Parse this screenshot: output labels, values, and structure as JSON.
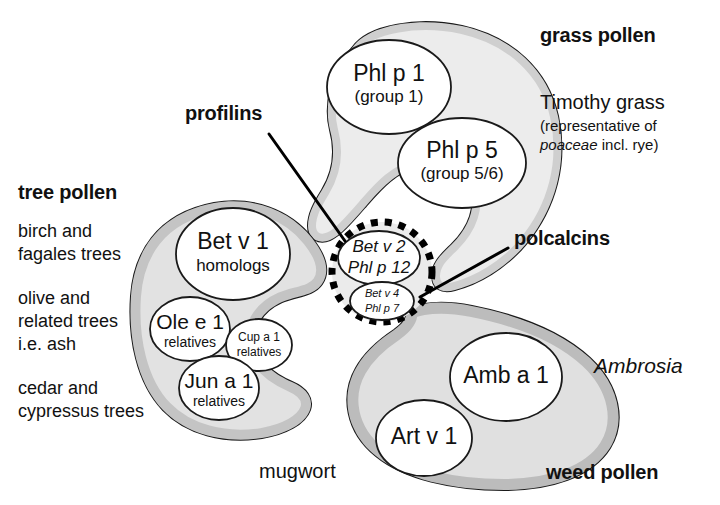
{
  "diagram": {
    "colors": {
      "lobe_light": "#ececec",
      "lobe_mid": "#d2d2d2",
      "lobe_dark": "#bcbcbc",
      "outline": "#1a1a1a",
      "text": "#111111"
    }
  },
  "labels": {
    "grass_pollen": "grass pollen",
    "timothy_grass": "Timothy grass",
    "timothy_sub1": "(representative of",
    "timothy_sub2_italic": "poaceae",
    "timothy_sub2_rest": " incl. rye)",
    "tree_pollen": "tree pollen",
    "tree_desc_1a": "birch and",
    "tree_desc_1b": "fagales trees",
    "tree_desc_2a": "olive and",
    "tree_desc_2b": "related trees",
    "tree_desc_2c": "i.e. ash",
    "tree_desc_3a": "cedar and",
    "tree_desc_3b": "cypressus trees",
    "profilins": "profilins",
    "polcalcins": "polcalcins",
    "ambrosia": "Ambrosia",
    "mugwort": "mugwort",
    "weed_pollen": "weed pollen"
  },
  "nodes": {
    "phl_p_1": {
      "name": "Phl p 1",
      "sub": "(group 1)"
    },
    "phl_p_5": {
      "name": "Phl p 5",
      "sub": "(group 5/6)"
    },
    "bet_v_1": {
      "name": "Bet v 1",
      "sub": "homologs"
    },
    "ole_e_1": {
      "name": "Ole e 1",
      "sub": "relatives"
    },
    "cup_a_1": {
      "name": "Cup a 1",
      "sub": "relatives"
    },
    "jun_a_1": {
      "name": "Jun a 1",
      "sub": "relatives"
    },
    "profilin_core": {
      "line1": "Bet v 2",
      "line2": "Phl p 12"
    },
    "polcalcin_core": {
      "line1": "Bet v 4",
      "line2": "Phl p 7"
    },
    "amb_a_1": {
      "name": "Amb a 1"
    },
    "art_v_1": {
      "name": "Art v 1"
    }
  }
}
